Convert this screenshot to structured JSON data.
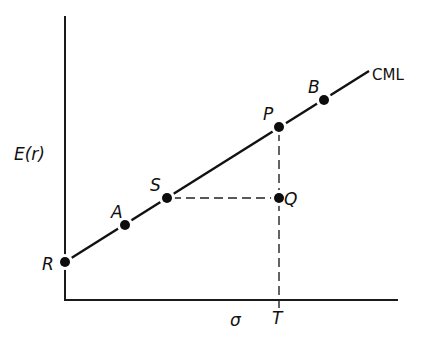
{
  "diagram": {
    "axes": {
      "y_label": "E(r)",
      "x_label": "σ",
      "origin": {
        "x": 65,
        "y": 300
      },
      "y_top": 16,
      "x_right": 398
    },
    "line": {
      "label": "CML",
      "start": {
        "x": 65,
        "y": 262
      },
      "end": {
        "x": 369,
        "y": 71
      }
    },
    "points": [
      {
        "id": "R",
        "label": "R",
        "x": 65,
        "y": 262,
        "label_x": 42,
        "label_y": 270
      },
      {
        "id": "A",
        "label": "A",
        "x": 125,
        "y": 225,
        "label_x": 111,
        "label_y": 218
      },
      {
        "id": "S",
        "label": "S",
        "x": 167,
        "y": 198,
        "label_x": 150,
        "label_y": 191
      },
      {
        "id": "P",
        "label": "P",
        "x": 279,
        "y": 127,
        "label_x": 263,
        "label_y": 120
      },
      {
        "id": "B",
        "label": "B",
        "x": 324,
        "y": 100,
        "label_x": 308,
        "label_y": 93
      },
      {
        "id": "Q",
        "label": "Q",
        "x": 279,
        "y": 198,
        "label_x": 284,
        "label_y": 205
      }
    ],
    "dashed_lines": [
      {
        "from": "S",
        "to": "Q",
        "x1": 167,
        "y1": 198,
        "x2": 279,
        "y2": 198
      },
      {
        "from": "P",
        "to": "T",
        "x1": 279,
        "y1": 127,
        "x2": 279,
        "y2": 306
      }
    ],
    "tick_labels": {
      "T": {
        "label": "T",
        "x": 272,
        "y": 324
      },
      "sigma": {
        "label": "σ",
        "x": 230,
        "y": 326
      }
    }
  }
}
